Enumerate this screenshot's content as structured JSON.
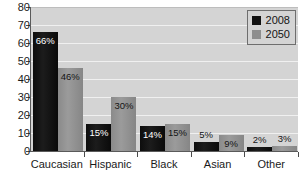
{
  "chart_data": {
    "type": "bar",
    "title": "",
    "xlabel": "",
    "ylabel": "",
    "ylim": [
      0,
      80
    ],
    "ytick_step": 10,
    "yticks": [
      "0",
      "10",
      "20",
      "30",
      "40",
      "50",
      "60",
      "70",
      "80"
    ],
    "grid": true,
    "legend_position": "top-right",
    "categories": [
      "Caucasian",
      "Hispanic",
      "Black",
      "Asian",
      "Other"
    ],
    "series": [
      {
        "name": "2008",
        "color": "#111111",
        "values": [
          66,
          15,
          14,
          5,
          2
        ],
        "labels": [
          "66%",
          "15%",
          "14%",
          "5%",
          "2%"
        ]
      },
      {
        "name": "2050",
        "color": "#8e8e8e",
        "values": [
          46,
          30,
          15,
          9,
          3
        ],
        "labels": [
          "46%",
          "30%",
          "15%",
          "9%",
          "3%"
        ]
      }
    ]
  },
  "legend": {
    "items": [
      {
        "label": "2008",
        "swatch": "s2008"
      },
      {
        "label": "2050",
        "swatch": "s2050"
      }
    ]
  },
  "colors": {
    "plot_background": "#d4d4d4",
    "gridline": "#f0f0f0",
    "axis": "#5a5a5a",
    "series_2008": "#111111",
    "series_2050": "#8e8e8e"
  }
}
